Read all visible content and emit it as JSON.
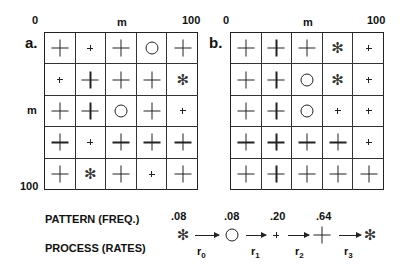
{
  "axis": {
    "start": "0",
    "mid": "m",
    "end": "100"
  },
  "panels": [
    {
      "label": "a.",
      "cells": [
        [
          "plus-big",
          "plus-small",
          "plus-big",
          "circle",
          "plus-big"
        ],
        [
          "plus-small",
          "plus-big",
          "plus-big",
          "plus-big",
          "star"
        ],
        [
          "plus-big",
          "plus-big",
          "circle",
          "plus-big",
          "plus-small"
        ],
        [
          "plus-big",
          "plus-small",
          "plus-big",
          "plus-big",
          "plus-big"
        ],
        [
          "plus-big",
          "star",
          "plus-big",
          "plus-small",
          "plus-big"
        ]
      ]
    },
    {
      "label": "b.",
      "cells": [
        [
          "plus-big",
          "plus-big",
          "plus-big",
          "star",
          "plus-small"
        ],
        [
          "plus-big",
          "plus-big",
          "circle",
          "star",
          "plus-small"
        ],
        [
          "plus-big",
          "plus-big",
          "circle",
          "plus-small",
          "plus-small"
        ],
        [
          "plus-big",
          "plus-big",
          "plus-big",
          "plus-big",
          "plus-small"
        ],
        [
          "plus-big",
          "plus-big",
          "plus-big",
          "plus-big",
          "plus-big"
        ]
      ]
    }
  ],
  "legend": {
    "pattern_label": "PATTERN (FREQ.)",
    "process_label": "PROCESS (RATES)",
    "freqs": [
      ".08",
      ".08",
      ".20",
      ".64"
    ],
    "symbols": [
      "star",
      "circle",
      "plus-small",
      "plus-big",
      "star"
    ],
    "rates": [
      {
        "r": "r",
        "sub": "0"
      },
      {
        "r": "r",
        "sub": "1"
      },
      {
        "r": "r",
        "sub": "2"
      },
      {
        "r": "r",
        "sub": "3"
      }
    ]
  }
}
